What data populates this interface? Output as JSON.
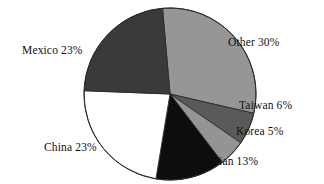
{
  "chart_data": {
    "type": "pie",
    "title": "",
    "subtitle": "",
    "xlabel": "",
    "ylabel": "",
    "legend_position": "none",
    "grid": false,
    "labels_outside": true,
    "start_angle_deg": -95,
    "direction": "clockwise",
    "categories": [
      "Other",
      "Taiwan",
      "Korea",
      "Asian",
      "China",
      "Mexico"
    ],
    "values": [
      30,
      6,
      5,
      13,
      23,
      23
    ],
    "unit": "%",
    "slices": [
      {
        "name": "Other",
        "value": 30,
        "label": "Other 30%",
        "color": "#969696",
        "stroke": "#2a2a2a"
      },
      {
        "name": "Taiwan",
        "value": 6,
        "label": "Taiwan 6%",
        "color": "#5a5a5a",
        "stroke": "#2a2a2a"
      },
      {
        "name": "Korea",
        "value": 5,
        "label": "Korea 5%",
        "color": "#949494",
        "stroke": "#2a2a2a"
      },
      {
        "name": "Asian",
        "value": 13,
        "label": "Asian 13%",
        "color": "#0d0d0d",
        "stroke": "#2a2a2a"
      },
      {
        "name": "China",
        "value": 23,
        "label": "China 23%",
        "color": "#ffffff",
        "stroke": "#2a2a2a"
      },
      {
        "name": "Mexico",
        "value": 23,
        "label": "Mexico 23%",
        "color": "#3a3a3a",
        "stroke": "#2a2a2a"
      }
    ]
  },
  "labels": {
    "other": "Other 30%",
    "taiwan": "Taiwan 6%",
    "korea": "Korea 5%",
    "asian": "Asian 13%",
    "china": "China 23%",
    "mexico": "Mexico 23%"
  },
  "geometry": {
    "center_x": 170,
    "center_y": 94,
    "radius": 86
  },
  "colors": {
    "background": "#ffffff",
    "text": "#101010",
    "outline": "#2a2a2a"
  }
}
